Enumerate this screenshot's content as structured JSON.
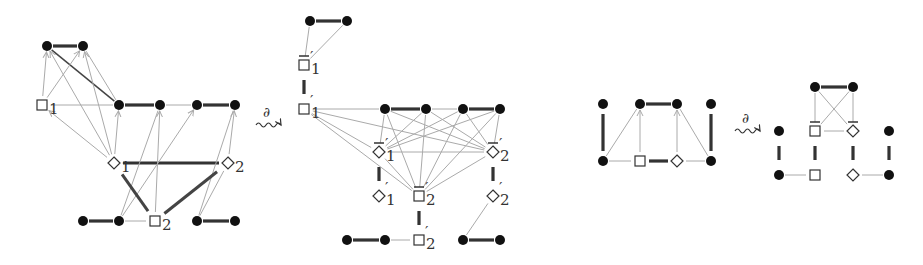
{
  "figure": {
    "arrow_symbol": "∂",
    "panels": [
      {
        "id": "left-original",
        "nodes": [
          {
            "id": "a1",
            "kind": "dot"
          },
          {
            "id": "a2",
            "kind": "dot"
          },
          {
            "id": "s1",
            "kind": "square",
            "label": "1"
          },
          {
            "id": "m1",
            "kind": "dot"
          },
          {
            "id": "m2",
            "kind": "dot"
          },
          {
            "id": "m3",
            "kind": "dot"
          },
          {
            "id": "m4",
            "kind": "dot"
          },
          {
            "id": "d1",
            "kind": "diamond",
            "label": "1"
          },
          {
            "id": "d2",
            "kind": "diamond",
            "label": "2"
          },
          {
            "id": "b1",
            "kind": "dot"
          },
          {
            "id": "b2",
            "kind": "dot"
          },
          {
            "id": "s2",
            "kind": "square",
            "label": "2"
          },
          {
            "id": "b3",
            "kind": "dot"
          },
          {
            "id": "b4",
            "kind": "dot"
          }
        ]
      },
      {
        "id": "left-derived",
        "nodes": [
          {
            "id": "t1",
            "kind": "dot"
          },
          {
            "id": "t2",
            "kind": "dot"
          },
          {
            "id": "s1bar",
            "kind": "square",
            "label": "1",
            "prime": true,
            "bar": true
          },
          {
            "id": "s1p",
            "kind": "square",
            "label": "1",
            "prime": true
          },
          {
            "id": "m1",
            "kind": "dot"
          },
          {
            "id": "m2",
            "kind": "dot"
          },
          {
            "id": "m3",
            "kind": "dot"
          },
          {
            "id": "m4",
            "kind": "dot"
          },
          {
            "id": "d1bar",
            "kind": "diamond",
            "label": "1",
            "prime": true,
            "bar": true
          },
          {
            "id": "d2bar",
            "kind": "diamond",
            "label": "2",
            "prime": true,
            "bar": true
          },
          {
            "id": "d1p",
            "kind": "diamond",
            "label": "1",
            "prime": true
          },
          {
            "id": "s2bar",
            "kind": "square",
            "label": "2",
            "prime": true,
            "bar": true
          },
          {
            "id": "d2p",
            "kind": "diamond",
            "label": "2",
            "prime": true
          },
          {
            "id": "b1",
            "kind": "dot"
          },
          {
            "id": "b2",
            "kind": "dot"
          },
          {
            "id": "s2p",
            "kind": "square",
            "label": "2",
            "prime": true
          },
          {
            "id": "b3",
            "kind": "dot"
          },
          {
            "id": "b4",
            "kind": "dot"
          }
        ]
      },
      {
        "id": "right-original",
        "nodes": [
          {
            "id": "tl",
            "kind": "dot"
          },
          {
            "id": "t1",
            "kind": "dot"
          },
          {
            "id": "t2",
            "kind": "dot"
          },
          {
            "id": "tr",
            "kind": "dot"
          },
          {
            "id": "bl",
            "kind": "dot"
          },
          {
            "id": "sq",
            "kind": "square"
          },
          {
            "id": "dm",
            "kind": "diamond"
          },
          {
            "id": "br",
            "kind": "dot"
          }
        ]
      },
      {
        "id": "right-derived",
        "nodes": [
          {
            "id": "t1",
            "kind": "dot"
          },
          {
            "id": "t2",
            "kind": "dot"
          },
          {
            "id": "ml",
            "kind": "dot"
          },
          {
            "id": "sqbar",
            "kind": "square",
            "bar": true
          },
          {
            "id": "dmbar",
            "kind": "diamond",
            "bar": true
          },
          {
            "id": "mr",
            "kind": "dot"
          },
          {
            "id": "bl",
            "kind": "dot"
          },
          {
            "id": "sq",
            "kind": "square"
          },
          {
            "id": "dm",
            "kind": "diamond"
          },
          {
            "id": "br",
            "kind": "dot"
          }
        ]
      }
    ]
  }
}
